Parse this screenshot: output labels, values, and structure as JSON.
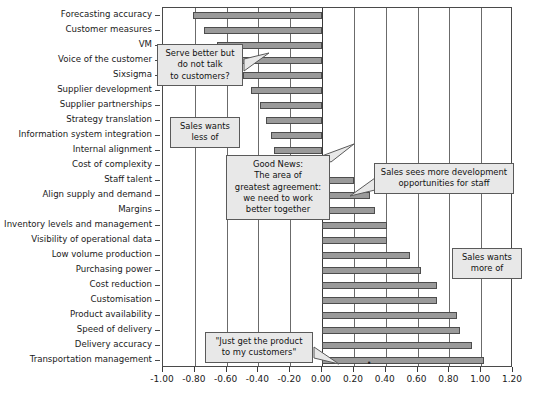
{
  "chart_data": {
    "type": "bar",
    "orientation": "horizontal",
    "title": "",
    "subtitle": "",
    "xlabel": "",
    "ylabel": "",
    "xlim": [
      -1.0,
      1.2
    ],
    "xticks": [
      -1.0,
      -0.8,
      -0.6,
      -0.4,
      -0.2,
      0.0,
      0.2,
      0.4,
      0.6,
      0.8,
      1.0,
      1.2
    ],
    "xtick_labels": [
      "-1.00",
      "-0.80",
      "-0.60",
      "-0.40",
      "-0.20",
      "0.00",
      "0.20",
      "0.40",
      "0.60",
      "0.80",
      "1.00",
      "1.20"
    ],
    "grid": true,
    "legend": false,
    "bar_color": "#9a9a9a",
    "bar_edge_color": "#4d4d4d",
    "categories": [
      "Forecasting accuracy",
      "Customer measures",
      "VM",
      "Voice of the customer",
      "Sixsigma",
      "Supplier development",
      "Supplier partnerships",
      "Strategy translation",
      "Information system integration",
      "Internal alignment",
      "Cost of complexity",
      "Staff talent",
      "Align supply and demand",
      "Margins",
      "Inventory levels and management",
      "Visibility of operational data",
      "Low volume production",
      "Purchasing power",
      "Cost reduction",
      "Customisation",
      "Product availability",
      "Speed of delivery",
      "Delivery accuracy",
      "Transportation management"
    ],
    "values": [
      -0.81,
      -0.74,
      -0.66,
      -0.65,
      -0.5,
      -0.45,
      -0.39,
      -0.35,
      -0.32,
      -0.3,
      -0.02,
      0.2,
      0.3,
      0.33,
      0.41,
      0.41,
      0.55,
      0.62,
      0.72,
      0.72,
      0.85,
      0.87,
      0.94,
      1.02
    ]
  },
  "annotations": [
    {
      "id": "serve-better",
      "lines": [
        "Serve better but",
        "do not talk",
        "to customers?"
      ],
      "target_category": "Voice of the customer"
    },
    {
      "id": "sales-wants-less",
      "lines": [
        "Sales wants",
        "less of"
      ],
      "target_category": ""
    },
    {
      "id": "good-news",
      "lines": [
        "Good News:",
        "The area of",
        "greatest agreement:",
        "we need to work",
        "better together"
      ],
      "target_category": "Cost of complexity"
    },
    {
      "id": "sales-development",
      "lines": [
        "Sales sees more development",
        "opportunities for staff"
      ],
      "target_category": "Margins"
    },
    {
      "id": "sales-wants-more",
      "lines": [
        "Sales wants",
        "more of"
      ],
      "target_category": ""
    },
    {
      "id": "just-get-product",
      "lines": [
        "\"Just get the product",
        "to my customers\""
      ],
      "target_category": "Transportation management"
    }
  ]
}
